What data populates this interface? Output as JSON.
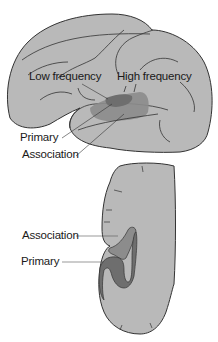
{
  "figure": {
    "lateral_view": {
      "labels": {
        "low_frequency": "Low frequency",
        "high_frequency": "High frequency",
        "primary": "Primary",
        "association": "Association"
      }
    },
    "coronal_section": {
      "labels": {
        "association": "Association",
        "primary": "Primary"
      }
    }
  },
  "colors": {
    "brain_fill": "#b9b9b9",
    "outline": "#333333",
    "primary_area": "#7a7a7a",
    "association_area": "#959595",
    "background": "#ffffff"
  }
}
